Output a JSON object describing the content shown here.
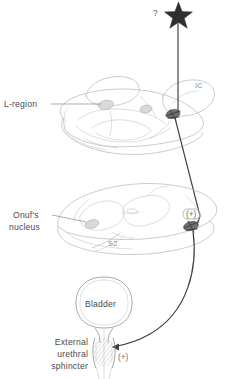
{
  "figure": {
    "background_color": "#ffffff",
    "ink_color": "#3d3d3d",
    "anatomy_line_color": "#b9b9b9",
    "label_color": "#4a4a4a",
    "faint_label_color": "#8e8e8e"
  },
  "labels": {
    "unknown_marker": "?",
    "ic": "IC",
    "l_region": "L-region",
    "onufs_line1": "Onuf's",
    "onufs_line2": "nucleus",
    "s2": "S2",
    "bladder": "Bladder",
    "sphincter_line1": "External",
    "sphincter_line2": "urethral",
    "sphincter_line3": "sphincter",
    "plus_cord": "(+)",
    "plus_sphincter": "(+)"
  },
  "structures": [
    {
      "name": "star-marker",
      "label": "?",
      "role": "unidentified supraspinal input"
    },
    {
      "name": "brainstem",
      "label": "IC",
      "role": "inferior colliculus landmark"
    },
    {
      "name": "l-region",
      "label": "L-region",
      "role": "pontine storage center"
    },
    {
      "name": "spinal-cord",
      "label": "S2",
      "role": "sacral segment S2"
    },
    {
      "name": "onufs-nucleus",
      "label": "Onuf's nucleus",
      "role": "motor neuron pool"
    },
    {
      "name": "bladder",
      "label": "Bladder",
      "role": "urinary bladder"
    },
    {
      "name": "external-urethral-sphincter",
      "label": "External urethral sphincter",
      "role": "striated sphincter"
    }
  ],
  "pathways": [
    {
      "name": "star-to-brainstem",
      "from": "?",
      "to": "L-region",
      "sign": ""
    },
    {
      "name": "brainstem-to-cord",
      "from": "L-region",
      "to": "Onuf's nucleus",
      "sign": "(+)"
    },
    {
      "name": "cord-to-sphincter",
      "from": "Onuf's nucleus",
      "to": "External urethral sphincter",
      "sign": "(+)"
    }
  ]
}
